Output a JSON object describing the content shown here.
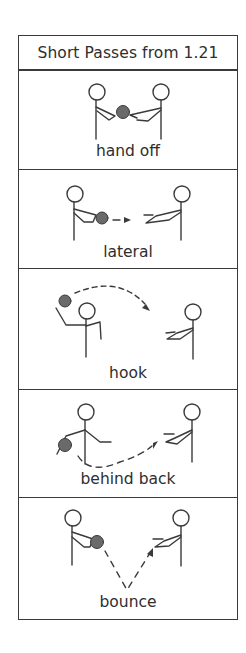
{
  "title": "Short Passes from 1.21",
  "passes": [
    {
      "label": "hand off"
    },
    {
      "label": "lateral"
    },
    {
      "label": "hook"
    },
    {
      "label": "behind back"
    },
    {
      "label": "bounce"
    }
  ],
  "colors": {
    "line": "#3a3a3a",
    "ball": "#6a6a6a",
    "text": "#2e2e2e"
  }
}
